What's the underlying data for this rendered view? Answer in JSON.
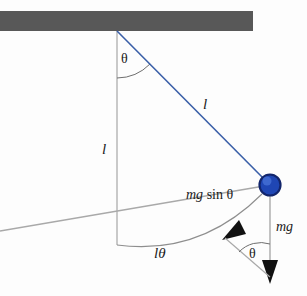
{
  "figure": {
    "type": "physics-free-body-diagram",
    "background_color": "#fdfdfd"
  },
  "ceiling": {
    "name": "support-bar",
    "color": "#585858",
    "x": 0,
    "y": 11,
    "width": 253,
    "height": 20
  },
  "pivot": {
    "x": 117,
    "y": 31
  },
  "bob": {
    "cx": 270,
    "cy": 185,
    "r": 10.5,
    "fill": "#1f46b4",
    "ring": "#12256b",
    "highlight": "#5b82e0"
  },
  "string": {
    "color": "#3a5fa8",
    "label": "l"
  },
  "vertical_reference": {
    "color": "#9a9a9a",
    "label": "l",
    "x": 117,
    "y_end": 245
  },
  "arc": {
    "color": "#8e8e8e",
    "label": "lθ"
  },
  "angles": {
    "top": {
      "label": "θ",
      "x": 125,
      "y": 55
    },
    "bottom": {
      "label": "θ",
      "x": 253,
      "y": 250
    }
  },
  "forces": [
    {
      "id": "mg-sin-theta",
      "var": "mg",
      "fn": " sin θ",
      "label": "mg sin θ",
      "color": "#a9a9a9",
      "arrow_fill": "#111111",
      "label_x": 186,
      "label_y": 188
    },
    {
      "id": "mg",
      "var": "mg",
      "fn": "",
      "label": "mg",
      "color": "#a9a9a9",
      "arrow_fill": "#111111",
      "label_x": 276,
      "label_y": 220
    }
  ],
  "labels": {
    "length_string": "l",
    "length_vertical": "l",
    "arc_length": "lθ",
    "theta_top": "θ",
    "theta_bottom": "θ"
  }
}
